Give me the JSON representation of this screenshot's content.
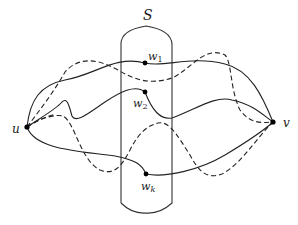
{
  "diagram": {
    "type": "graph-separator-illustration",
    "separator": {
      "label": "S"
    },
    "vertices": [
      {
        "id": "u",
        "label": "u",
        "x": 27,
        "y": 127
      },
      {
        "id": "v",
        "label": "v",
        "x": 273,
        "y": 122
      }
    ],
    "separator_vertices": [
      {
        "id": "w1",
        "label": "w",
        "subscript": "1",
        "x": 145,
        "y": 63
      },
      {
        "id": "w2",
        "label": "w",
        "subscript": "2",
        "x": 145,
        "y": 92
      },
      {
        "id": "wk",
        "label": "w",
        "subscript": "k",
        "x": 146,
        "y": 174
      }
    ],
    "solid_paths": [
      {
        "from": "u",
        "via": "w1",
        "to": "v"
      },
      {
        "from": "u",
        "via": "w2",
        "to": "v"
      },
      {
        "from": "u",
        "via": "wk",
        "to": "v"
      }
    ],
    "dashed_paths_count": 3,
    "line_color": "#222222",
    "background": "#ffffff"
  }
}
